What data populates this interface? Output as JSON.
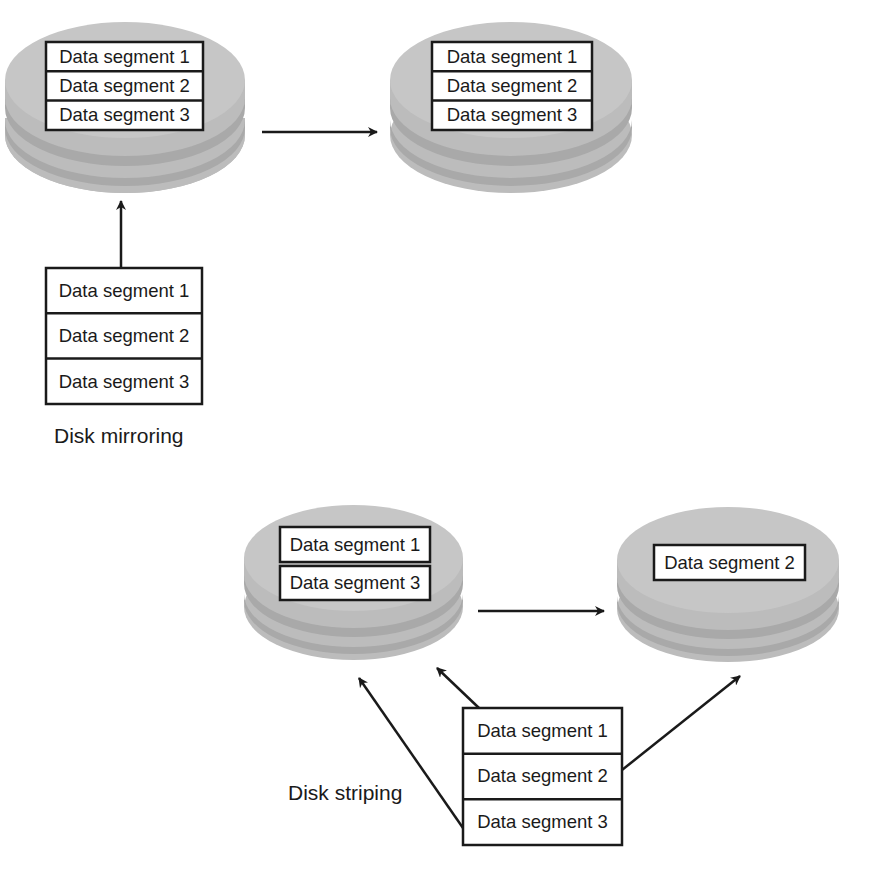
{
  "colors": {
    "disk_top": "#c6c6c6",
    "disk_band": "#a9a9a9",
    "disk_side": "#bcbcbc",
    "box_fill": "#ffffff",
    "box_stroke": "#1a1a1a",
    "arrow": "#1a1a1a",
    "text": "#1a1a1a"
  },
  "mirroring": {
    "caption": "Disk mirroring",
    "primary_disk": {
      "segments": [
        "Data segment 1",
        "Data segment 2",
        "Data segment 3"
      ]
    },
    "mirror_disk": {
      "segments": [
        "Data segment 1",
        "Data segment 2",
        "Data segment 3"
      ]
    },
    "source": {
      "segments": [
        "Data segment 1",
        "Data segment 2",
        "Data segment 3"
      ]
    }
  },
  "striping": {
    "caption": "Disk striping",
    "disk_a": {
      "segments": [
        "Data segment 1",
        "Data segment 3"
      ]
    },
    "disk_b": {
      "segments": [
        "Data segment 2"
      ]
    },
    "source": {
      "segments": [
        "Data segment 1",
        "Data segment 2",
        "Data segment 3"
      ]
    }
  }
}
